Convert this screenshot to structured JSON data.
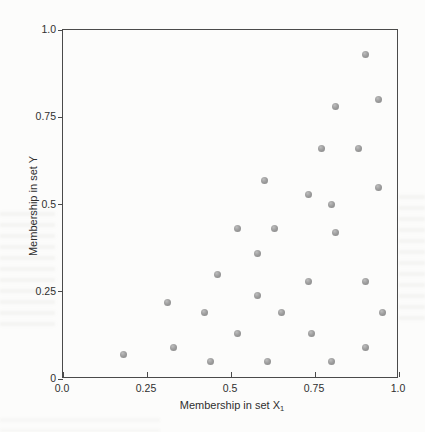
{
  "chart_data": {
    "type": "scatter",
    "title": "",
    "xlabel_main": "Membership in set X",
    "xlabel_subscript": "1",
    "ylabel": "Membership in set Y",
    "xlim": [
      0,
      1
    ],
    "ylim": [
      0,
      1
    ],
    "grid": false,
    "legend": "none",
    "x_ticks": [
      {
        "value": 0,
        "label": "0.0"
      },
      {
        "value": 0.25,
        "label": "0.25"
      },
      {
        "value": 0.5,
        "label": "0.5"
      },
      {
        "value": 0.75,
        "label": "0.75"
      },
      {
        "value": 1,
        "label": "1.0"
      }
    ],
    "y_ticks": [
      {
        "value": 0,
        "label": "0"
      },
      {
        "value": 0.25,
        "label": "0.25"
      },
      {
        "value": 0.5,
        "label": "0.5"
      },
      {
        "value": 0.75,
        "label": "0.75"
      },
      {
        "value": 1,
        "label": "1.0"
      }
    ],
    "points": [
      [
        0.9,
        0.93
      ],
      [
        0.94,
        0.8
      ],
      [
        0.81,
        0.78
      ],
      [
        0.77,
        0.66
      ],
      [
        0.88,
        0.66
      ],
      [
        0.6,
        0.57
      ],
      [
        0.94,
        0.55
      ],
      [
        0.73,
        0.53
      ],
      [
        0.8,
        0.5
      ],
      [
        0.52,
        0.43
      ],
      [
        0.63,
        0.43
      ],
      [
        0.81,
        0.42
      ],
      [
        0.58,
        0.36
      ],
      [
        0.46,
        0.3
      ],
      [
        0.73,
        0.28
      ],
      [
        0.9,
        0.28
      ],
      [
        0.58,
        0.24
      ],
      [
        0.31,
        0.22
      ],
      [
        0.42,
        0.19
      ],
      [
        0.65,
        0.19
      ],
      [
        0.95,
        0.19
      ],
      [
        0.52,
        0.13
      ],
      [
        0.74,
        0.13
      ],
      [
        0.33,
        0.09
      ],
      [
        0.9,
        0.09
      ],
      [
        0.18,
        0.07
      ],
      [
        0.44,
        0.05
      ],
      [
        0.61,
        0.05
      ],
      [
        0.8,
        0.05
      ]
    ],
    "marker": {
      "shape": "circle",
      "diameter_px": 7,
      "fill": "#9e9e9e",
      "highlight": "#bdbdbd",
      "edge": "#848484"
    },
    "colors": {
      "axis": "#4a4a4a",
      "text": "#2f2f2f",
      "background": "#fcfcfb"
    }
  }
}
